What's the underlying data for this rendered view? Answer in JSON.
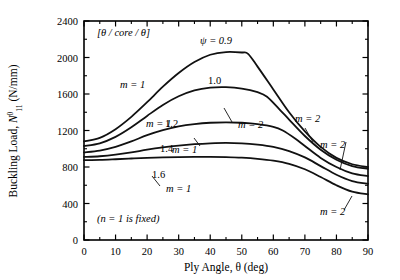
{
  "chart_data": {
    "type": "line",
    "title": "",
    "xlabel": "Ply Angle, θ (deg)",
    "ylabel": "Buckling Load, N⁰₁₁ (N/mm)",
    "ylabel_parts": {
      "main": "Buckling Load, ",
      "symbol": "N",
      "sup": "0",
      "sub": "11",
      "units": " (N/mm)"
    },
    "xlim": [
      0,
      90
    ],
    "ylim": [
      0,
      2400
    ],
    "xticks": [
      0,
      10,
      20,
      30,
      40,
      50,
      60,
      70,
      80,
      90
    ],
    "yticks": [
      0,
      400,
      800,
      1200,
      1600,
      2000,
      2400
    ],
    "xtick_labels": [
      "0",
      "10",
      "20",
      "30",
      "40",
      "50",
      "60",
      "70",
      "80",
      "90"
    ],
    "ytick_labels": [
      "0",
      "400",
      "800",
      "1200",
      "1600",
      "2000",
      "2400"
    ],
    "x_minor_step": 5,
    "y_minor_step": 200,
    "grid": false,
    "legend_position": "inline-annotations",
    "frame": true,
    "series": [
      {
        "name": "ψ = 0.9",
        "psi": 0.9,
        "x": [
          0,
          5,
          10,
          15,
          20,
          25,
          30,
          35,
          40,
          45,
          50,
          52,
          55,
          60,
          65,
          70,
          75,
          80,
          85,
          90
        ],
        "values": [
          1080,
          1120,
          1215,
          1350,
          1510,
          1680,
          1830,
          1950,
          2030,
          2060,
          2055,
          2040,
          1900,
          1650,
          1400,
          1190,
          1020,
          900,
          830,
          800
        ],
        "mode_left": "m = 1",
        "mode_right": "m = 2",
        "transition_x": 52
      },
      {
        "name": "ψ = 1.0",
        "psi": 1.0,
        "x": [
          0,
          5,
          10,
          15,
          20,
          25,
          30,
          35,
          40,
          45,
          50,
          55,
          58,
          62,
          65,
          70,
          75,
          80,
          85,
          90
        ],
        "values": [
          1030,
          1060,
          1130,
          1235,
          1360,
          1480,
          1575,
          1640,
          1670,
          1675,
          1660,
          1620,
          1570,
          1430,
          1320,
          1140,
          990,
          880,
          810,
          780
        ],
        "mode_left": "m = 1",
        "mode_right": "m = 2",
        "transition_x": 58
      },
      {
        "name": "ψ = 1.2",
        "psi": 1.2,
        "x": [
          0,
          5,
          10,
          15,
          20,
          25,
          30,
          35,
          40,
          45,
          50,
          55,
          60,
          63,
          67,
          70,
          75,
          80,
          85,
          90
        ],
        "values": [
          960,
          980,
          1020,
          1080,
          1150,
          1205,
          1245,
          1270,
          1285,
          1290,
          1285,
          1270,
          1240,
          1200,
          1110,
          1030,
          900,
          800,
          730,
          700
        ],
        "mode_left": "m = 1",
        "mode_right": "m = 2",
        "transition_x": 63
      },
      {
        "name": "ψ = 1.4",
        "psi": 1.4,
        "x": [
          0,
          5,
          10,
          15,
          20,
          25,
          30,
          35,
          40,
          45,
          50,
          55,
          60,
          65,
          70,
          75,
          80,
          85,
          90
        ],
        "values": [
          910,
          918,
          935,
          960,
          990,
          1015,
          1035,
          1050,
          1060,
          1065,
          1060,
          1045,
          1020,
          975,
          905,
          810,
          715,
          645,
          615
        ],
        "mode_left": "m = 1",
        "mode_right": "m = 2",
        "transition_x": 68
      },
      {
        "name": "ψ = 1.6",
        "psi": 1.6,
        "x": [
          0,
          5,
          10,
          15,
          20,
          25,
          30,
          35,
          40,
          45,
          50,
          55,
          60,
          65,
          70,
          75,
          80,
          85,
          90
        ],
        "values": [
          875,
          878,
          885,
          893,
          900,
          905,
          908,
          910,
          910,
          908,
          902,
          890,
          870,
          835,
          775,
          690,
          600,
          530,
          500
        ],
        "mode_left": "m = 1",
        "mode_right": "m = 2",
        "transition_x": 72
      }
    ],
    "annotations": [
      {
        "id": "stacking-sequence",
        "text": "[θ / core / θ]",
        "x_px": 97,
        "y_px": 36
      },
      {
        "id": "n-fixed-note",
        "text": "(n = 1 is fixed)",
        "x_px": 97,
        "y_px": 222
      },
      {
        "id": "psi-09",
        "text": "ψ = 0.9",
        "x_px": 200,
        "y_px": 44
      },
      {
        "id": "psi-10",
        "text": "1.0",
        "x_px": 208,
        "y_px": 84
      },
      {
        "id": "psi-12",
        "text": "1.2",
        "x_px": 165,
        "y_px": 127
      },
      {
        "id": "psi-14",
        "text": "1.4",
        "x_px": 160,
        "y_px": 152
      },
      {
        "id": "psi-16",
        "text": "1.6",
        "x_px": 152,
        "y_px": 178
      },
      {
        "id": "m1-a",
        "text": "m = 1",
        "x_px": 120,
        "y_px": 88
      },
      {
        "id": "m1-b",
        "text": "m = 1",
        "x_px": 146,
        "y_px": 127
      },
      {
        "id": "m1-c",
        "text": "m = 1",
        "x_px": 172,
        "y_px": 153
      },
      {
        "id": "m1-d",
        "text": "m = 1",
        "x_px": 166,
        "y_px": 192
      },
      {
        "id": "m2-a",
        "text": "m = 2",
        "x_px": 238,
        "y_px": 128
      },
      {
        "id": "m2-b",
        "text": "m = 2",
        "x_px": 295,
        "y_px": 122
      },
      {
        "id": "m2-c",
        "text": "m = 2",
        "x_px": 320,
        "y_px": 148
      },
      {
        "id": "m2-d",
        "text": "m = 2",
        "x_px": 320,
        "y_px": 215
      }
    ]
  },
  "plot": {
    "left_px": 84,
    "right_px": 368,
    "top_px": 21,
    "bottom_px": 240
  },
  "style": {
    "line_color": "#111111",
    "axis_color": "#000000",
    "background": "#ffffff",
    "text_color": "#000000"
  }
}
